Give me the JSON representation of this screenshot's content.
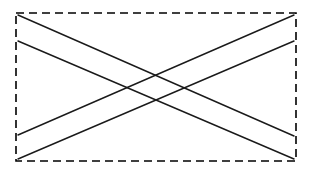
{
  "figure": {
    "canvas": {
      "width": 312,
      "height": 172,
      "background": "#ffffff"
    },
    "frame": {
      "name": "dashed-rectangle-border",
      "x": 16,
      "y": 13,
      "width": 280,
      "height": 148,
      "stroke": "#000000",
      "stroke_width": 1.6,
      "dash": "8 5",
      "fill": "none"
    },
    "strokes": {
      "color": "#1a1a1a",
      "width": 1.4
    },
    "bands": [
      {
        "name": "band-descending",
        "description": "Band running from upper-left down to lower-right",
        "lines": [
          {
            "name": "descending-upper-line",
            "x1": 18,
            "y1": 15,
            "x2": 294,
            "y2": 136
          },
          {
            "name": "descending-lower-line",
            "x1": 18,
            "y1": 41,
            "x2": 294,
            "y2": 159
          }
        ]
      },
      {
        "name": "band-ascending",
        "description": "Band running from lower-left up to upper-right",
        "lines": [
          {
            "name": "ascending-upper-line",
            "x1": 18,
            "y1": 135,
            "x2": 294,
            "y2": 15
          },
          {
            "name": "ascending-lower-line",
            "x1": 18,
            "y1": 159,
            "x2": 294,
            "y2": 41
          }
        ]
      }
    ],
    "intersections": [
      {
        "name": "crossing-center-upper",
        "x": 156,
        "y": 76
      },
      {
        "name": "crossing-center-lower",
        "x": 156,
        "y": 99
      },
      {
        "name": "crossing-left",
        "x": 122,
        "y": 88
      },
      {
        "name": "crossing-right",
        "x": 190,
        "y": 87
      }
    ]
  }
}
